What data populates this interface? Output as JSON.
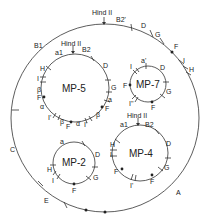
{
  "figure": {
    "outer": {
      "labels": [
        "Hind II",
        "B2'",
        "D",
        "G",
        "F",
        "I",
        "H",
        "A",
        "E",
        "C",
        "B1"
      ]
    },
    "plasmids": [
      {
        "name": "MP-5",
        "labels": [
          "Hind II",
          "a1",
          "B2",
          "D",
          "G",
          "a",
          "F",
          "β",
          "I'",
          "α",
          "F",
          "β",
          "I'",
          "α",
          "F",
          "β",
          "I",
          "H"
        ]
      },
      {
        "name": "MP-7",
        "labels": [
          "a'",
          "D",
          "G",
          "F",
          "I''",
          "F",
          "I"
        ]
      },
      {
        "name": "MP-4",
        "labels": [
          "Hind II",
          "a1",
          "B2",
          "D",
          "G",
          "F",
          "I'",
          "F",
          "I",
          "H"
        ]
      },
      {
        "name": "MP-2",
        "labels": [
          "a",
          "D",
          "G",
          "F",
          "I",
          "H"
        ]
      }
    ]
  },
  "outer_labels": {
    "hind": "Hind II",
    "b2": "B2'",
    "d": "D",
    "g": "G",
    "f": "F",
    "i": "I",
    "h": "H",
    "a": "A",
    "e": "E",
    "c": "C",
    "b1": "B1"
  },
  "mp5": {
    "name": "MP-5",
    "hind": "Hind II",
    "a1": "a1",
    "b2": "B2",
    "d": "D",
    "g": "G",
    "a": "a",
    "f1": "F",
    "beta1": "β",
    "i1": "I'",
    "alpha1": "α",
    "f2": "F",
    "beta2": "β",
    "i2": "I'",
    "alpha2": "α",
    "f3": "F",
    "beta3": "β",
    "i3": "I",
    "h": "H"
  },
  "mp7": {
    "name": "MP-7",
    "a": "a'",
    "d": "D",
    "g": "G",
    "f1": "F",
    "i1": "I''",
    "f2": "F",
    "i2": "I"
  },
  "mp4": {
    "name": "MP-4",
    "hind": "Hind II",
    "a1": "a1",
    "b2": "B2",
    "d": "D",
    "g": "G",
    "f1": "F",
    "i1": "I'",
    "f2": "F",
    "i2": "I",
    "h": "H"
  },
  "mp2": {
    "name": "MP-2",
    "a": "a",
    "d": "D",
    "g": "G",
    "f": "F",
    "i": "I",
    "h": "H"
  }
}
